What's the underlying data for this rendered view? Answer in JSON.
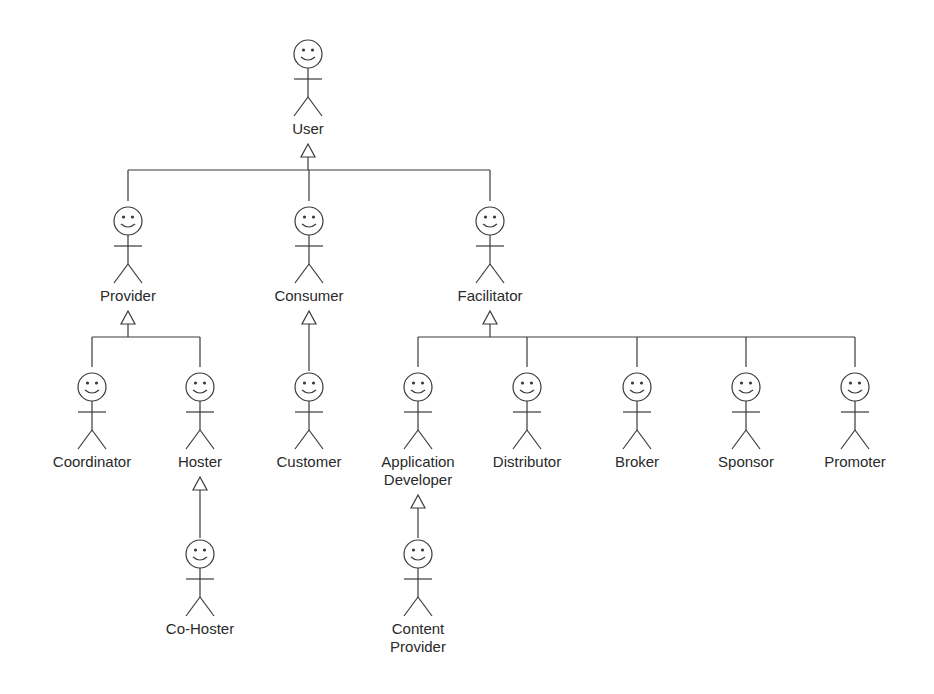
{
  "diagram": {
    "type": "uml-actor-generalization",
    "colors": {
      "stroke": "#3a3a3a",
      "text": "#2a2a2a",
      "background": "#ffffff"
    },
    "actors": [
      {
        "id": "user",
        "label": "User",
        "x": 308,
        "y": 40
      },
      {
        "id": "provider",
        "label": "Provider",
        "x": 128,
        "y": 207
      },
      {
        "id": "consumer",
        "label": "Consumer",
        "x": 309,
        "y": 207
      },
      {
        "id": "facilitator",
        "label": "Facilitator",
        "x": 490,
        "y": 207
      },
      {
        "id": "coordinator",
        "label": "Coordinator",
        "x": 92,
        "y": 373
      },
      {
        "id": "hoster",
        "label": "Hoster",
        "x": 200,
        "y": 373
      },
      {
        "id": "customer",
        "label": "Customer",
        "x": 309,
        "y": 373
      },
      {
        "id": "application-developer",
        "label": "Application\nDeveloper",
        "x": 418,
        "y": 373
      },
      {
        "id": "distributor",
        "label": "Distributor",
        "x": 527,
        "y": 373
      },
      {
        "id": "broker",
        "label": "Broker",
        "x": 637,
        "y": 373
      },
      {
        "id": "sponsor",
        "label": "Sponsor",
        "x": 746,
        "y": 373
      },
      {
        "id": "promoter",
        "label": "Promoter",
        "x": 855,
        "y": 373
      },
      {
        "id": "co-hoster",
        "label": "Co-Hoster",
        "x": 200,
        "y": 540
      },
      {
        "id": "content-provider",
        "label": "Content\nProvider",
        "x": 418,
        "y": 540
      }
    ],
    "generalizations": [
      {
        "parent": "user",
        "children": [
          "provider",
          "consumer",
          "facilitator"
        ]
      },
      {
        "parent": "provider",
        "children": [
          "coordinator",
          "hoster"
        ]
      },
      {
        "parent": "consumer",
        "children": [
          "customer"
        ]
      },
      {
        "parent": "facilitator",
        "children": [
          "application-developer",
          "distributor",
          "broker",
          "sponsor",
          "promoter"
        ]
      },
      {
        "parent": "hoster",
        "children": [
          "co-hoster"
        ]
      },
      {
        "parent": "application-developer",
        "children": [
          "content-provider"
        ]
      }
    ]
  }
}
